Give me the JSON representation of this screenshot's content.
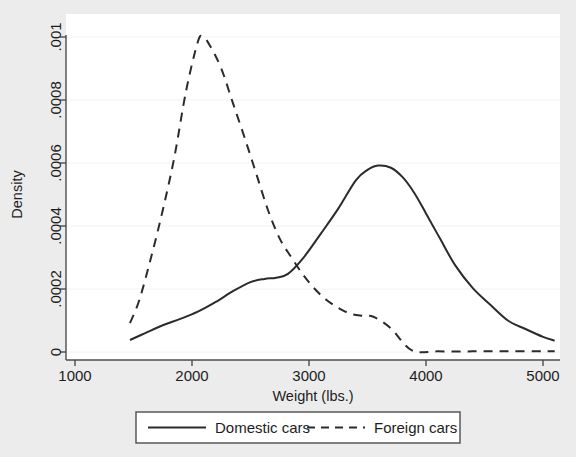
{
  "figure": {
    "background_color": "#ececec",
    "plot_background_color": "#ffffff",
    "line_color": "#2b2b2b",
    "grid_color": "#f2f2f2",
    "axis_color": "#4d4d4d"
  },
  "chart_data": {
    "type": "line",
    "title": "",
    "xlabel": "Weight (lbs.)",
    "ylabel": "Density",
    "xlim": [
      1000,
      5100
    ],
    "ylim": [
      0,
      0.00105
    ],
    "xticks": [
      1000,
      2000,
      3000,
      4000,
      5000
    ],
    "xtick_labels": [
      "1000",
      "2000",
      "3000",
      "4000",
      "5000"
    ],
    "yticks": [
      0,
      0.0002,
      0.0004,
      0.0006,
      0.0008,
      0.001
    ],
    "ytick_labels": [
      "0",
      ".0002",
      ".0004",
      ".0006",
      ".0008",
      ".001"
    ],
    "grid": true,
    "grid_axis": "y",
    "legend_position": "below",
    "legend_entries": [
      "Domestic cars",
      "Foreign cars"
    ],
    "series": [
      {
        "name": "Domestic cars",
        "style": "solid",
        "x": [
          1470,
          1600,
          1750,
          1900,
          2050,
          2200,
          2350,
          2500,
          2620,
          2720,
          2820,
          2950,
          3100,
          3250,
          3400,
          3500,
          3590,
          3700,
          3800,
          3900,
          4000,
          4120,
          4250,
          4400,
          4550,
          4700,
          4850,
          5000,
          5100
        ],
        "y": [
          3.8e-05,
          6e-05,
          8.5e-05,
          0.000105,
          0.000128,
          0.000158,
          0.000193,
          0.000222,
          0.000232,
          0.000236,
          0.000248,
          0.000298,
          0.000375,
          0.000455,
          0.000545,
          0.000578,
          0.000592,
          0.000585,
          0.000555,
          0.000505,
          0.00044,
          0.00036,
          0.000275,
          0.000203,
          0.00015,
          0.0001,
          7.3e-05,
          4.8e-05,
          3.6e-05
        ]
      },
      {
        "name": "Foreign cars",
        "style": "dashed",
        "x": [
          1470,
          1550,
          1650,
          1750,
          1850,
          1950,
          2050,
          2094,
          2150,
          2250,
          2350,
          2450,
          2550,
          2650,
          2750,
          2850,
          2950,
          3050,
          3150,
          3250,
          3350,
          3450,
          3550,
          3700,
          3880,
          4100,
          4400,
          4700,
          5000,
          5100
        ],
        "y": [
          9.2e-05,
          0.000165,
          0.0003,
          0.00045,
          0.00062,
          0.00083,
          0.000985,
          0.001,
          0.000975,
          0.0009,
          0.00079,
          0.00068,
          0.000565,
          0.00045,
          0.00036,
          0.0003,
          0.000245,
          0.0002,
          0.000165,
          0.00014,
          0.000122,
          0.000115,
          0.000112,
          7.5e-05,
          5e-06,
          2e-06,
          2e-06,
          2e-06,
          2e-06,
          2e-06
        ]
      }
    ],
    "annotations": {
      "domestic_peak": {
        "x": 3590,
        "y": 0.00059
      },
      "foreign_peak": {
        "x": 2094,
        "y": 0.001
      }
    }
  }
}
